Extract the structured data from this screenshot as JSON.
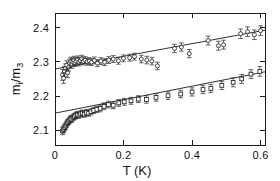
{
  "figure": {
    "background_color": "#ffffff",
    "ink_color": "#1a1a1a"
  },
  "chart_data": {
    "type": "scatter",
    "title": "",
    "subtitle": "",
    "xlabel": "T (K)",
    "xlabel_symbol": "T",
    "xlabel_units": "(K)",
    "ylabel": "m_i/m_3",
    "ylabel_numerator": "m",
    "ylabel_numerator_sub": "i",
    "ylabel_denominator": "m",
    "ylabel_denominator_sub": "3",
    "xlim": [
      0.0,
      0.613
    ],
    "ylim": [
      2.057,
      2.4425
    ],
    "xticks": [
      0,
      0.2,
      0.4,
      0.6
    ],
    "xtick_labels": [
      "0",
      "0.2",
      "0.4",
      "0.6"
    ],
    "yticks": [
      2.1,
      2.2,
      2.3,
      2.4
    ],
    "ytick_labels": [
      "2.1",
      "2.2",
      "2.3",
      "2.4"
    ],
    "grid": false,
    "legend": false,
    "legend_position": "none",
    "frame": "box",
    "series": [
      {
        "name": "upper-series-circles",
        "marker": "open-circle",
        "marker_size": 4.0,
        "error_bars": "y",
        "x": [
          0.022,
          0.025,
          0.028,
          0.031,
          0.034,
          0.037,
          0.04,
          0.043,
          0.046,
          0.049,
          0.052,
          0.055,
          0.058,
          0.062,
          0.066,
          0.07,
          0.074,
          0.078,
          0.083,
          0.088,
          0.094,
          0.1,
          0.107,
          0.115,
          0.124,
          0.134,
          0.145,
          0.157,
          0.17,
          0.185,
          0.2,
          0.218,
          0.232,
          0.252,
          0.268,
          0.283,
          0.299,
          0.349,
          0.369,
          0.392,
          0.447,
          0.477,
          0.492,
          0.542,
          0.562,
          0.582,
          0.6
        ],
        "y": [
          2.262,
          2.252,
          2.272,
          2.281,
          2.29,
          2.268,
          2.285,
          2.296,
          2.302,
          2.293,
          2.299,
          2.305,
          2.297,
          2.301,
          2.307,
          2.299,
          2.303,
          2.309,
          2.301,
          2.305,
          2.3,
          2.302,
          2.299,
          2.304,
          2.296,
          2.302,
          2.299,
          2.305,
          2.308,
          2.303,
          2.31,
          2.312,
          2.315,
          2.308,
          2.305,
          2.302,
          2.288,
          2.339,
          2.343,
          2.324,
          2.362,
          2.347,
          2.35,
          2.382,
          2.388,
          2.379,
          2.391
        ],
        "yerr": [
          0.016,
          0.015,
          0.014,
          0.013,
          0.013,
          0.014,
          0.012,
          0.012,
          0.011,
          0.012,
          0.011,
          0.011,
          0.011,
          0.011,
          0.01,
          0.011,
          0.01,
          0.01,
          0.01,
          0.01,
          0.01,
          0.01,
          0.01,
          0.01,
          0.01,
          0.01,
          0.01,
          0.01,
          0.01,
          0.01,
          0.01,
          0.01,
          0.01,
          0.011,
          0.011,
          0.011,
          0.011,
          0.012,
          0.012,
          0.012,
          0.013,
          0.013,
          0.013,
          0.014,
          0.014,
          0.014,
          0.014
        ]
      },
      {
        "name": "lower-series-squares",
        "marker": "open-square",
        "marker_size": 3.8,
        "error_bars": "y",
        "x": [
          0.022,
          0.025,
          0.028,
          0.031,
          0.034,
          0.037,
          0.04,
          0.043,
          0.046,
          0.049,
          0.053,
          0.057,
          0.061,
          0.065,
          0.07,
          0.075,
          0.08,
          0.086,
          0.092,
          0.098,
          0.105,
          0.113,
          0.122,
          0.132,
          0.143,
          0.156,
          0.17,
          0.186,
          0.202,
          0.222,
          0.243,
          0.267,
          0.295,
          0.33,
          0.367,
          0.4,
          0.432,
          0.455,
          0.487,
          0.52,
          0.545,
          0.572,
          0.598
        ],
        "y": [
          2.098,
          2.102,
          2.108,
          2.112,
          2.118,
          2.122,
          2.126,
          2.13,
          2.134,
          2.132,
          2.138,
          2.14,
          2.143,
          2.146,
          2.144,
          2.148,
          2.15,
          2.147,
          2.152,
          2.15,
          2.154,
          2.158,
          2.161,
          2.164,
          2.17,
          2.175,
          2.173,
          2.18,
          2.183,
          2.186,
          2.191,
          2.19,
          2.196,
          2.201,
          2.206,
          2.212,
          2.219,
          2.222,
          2.231,
          2.24,
          2.25,
          2.264,
          2.272
        ],
        "yerr": [
          0.011,
          0.01,
          0.01,
          0.01,
          0.009,
          0.009,
          0.009,
          0.009,
          0.009,
          0.009,
          0.009,
          0.009,
          0.009,
          0.009,
          0.009,
          0.009,
          0.009,
          0.009,
          0.009,
          0.009,
          0.009,
          0.009,
          0.009,
          0.01,
          0.01,
          0.01,
          0.01,
          0.01,
          0.01,
          0.01,
          0.01,
          0.011,
          0.011,
          0.011,
          0.011,
          0.012,
          0.012,
          0.012,
          0.012,
          0.013,
          0.013,
          0.013,
          0.014
        ]
      }
    ],
    "fits": [
      {
        "name": "upper-fit-line",
        "intercept": 2.279,
        "slope": 0.185,
        "x_start": 0.0,
        "x_end": 0.613
      },
      {
        "name": "lower-fit-line",
        "intercept": 2.15,
        "slope": 0.197,
        "x_start": 0.0,
        "x_end": 0.613
      }
    ]
  }
}
